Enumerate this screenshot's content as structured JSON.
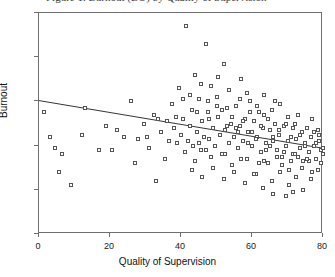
{
  "figure": {
    "top_clipped_caption": "Figure 1. Burnout (BO) by Quality of Supervision",
    "background_color": "#ffffff",
    "frame_color": "#6f6f6f",
    "marker_edge_color": "#555555",
    "regression_line_color": "#333333"
  },
  "chart_data": {
    "type": "scatter",
    "title": "",
    "xlabel": "Quality of Supervision",
    "ylabel": "Burnout",
    "xlim": [
      0,
      80
    ],
    "ylim": [
      0,
      50
    ],
    "xticks": [
      0,
      20,
      40,
      60,
      80
    ],
    "yticks": [
      0,
      10,
      20,
      30,
      40,
      50
    ],
    "grid": false,
    "legend": null,
    "marker": "open-square",
    "trendline": {
      "type": "linear-regression",
      "x_start": 0,
      "y_start": 30.0,
      "x_end": 80,
      "y_end": 19.2,
      "slope": -0.135,
      "intercept": 30.0
    },
    "points": [
      [
        1.5,
        27.5
      ],
      [
        3.0,
        22.0
      ],
      [
        4.5,
        19.5
      ],
      [
        5.5,
        14.0
      ],
      [
        6.5,
        18.0
      ],
      [
        9.0,
        11.0
      ],
      [
        12.0,
        22.5
      ],
      [
        13.0,
        28.5
      ],
      [
        17.0,
        19.0
      ],
      [
        19.0,
        24.5
      ],
      [
        20.5,
        19.0
      ],
      [
        22.0,
        23.5
      ],
      [
        24.0,
        22.0
      ],
      [
        26.0,
        30.0
      ],
      [
        27.0,
        16.0
      ],
      [
        28.0,
        21.5
      ],
      [
        29.5,
        25.0
      ],
      [
        31.0,
        19.5
      ],
      [
        32.5,
        27.0
      ],
      [
        33.0,
        12.0
      ],
      [
        34.5,
        23.0
      ],
      [
        35.5,
        17.0
      ],
      [
        36.5,
        21.0
      ],
      [
        37.5,
        29.5
      ],
      [
        38.0,
        24.0
      ],
      [
        39.0,
        20.5
      ],
      [
        39.5,
        33.0
      ],
      [
        40.0,
        22.5
      ],
      [
        40.5,
        26.0
      ],
      [
        41.0,
        18.5
      ],
      [
        41.5,
        47.0
      ],
      [
        42.0,
        21.0
      ],
      [
        42.5,
        24.5
      ],
      [
        43.0,
        28.0
      ],
      [
        43.5,
        20.0
      ],
      [
        44.0,
        16.5
      ],
      [
        44.5,
        23.0
      ],
      [
        45.0,
        30.5
      ],
      [
        45.5,
        19.0
      ],
      [
        46.0,
        25.5
      ],
      [
        46.5,
        22.0
      ],
      [
        47.0,
        43.0
      ],
      [
        47.5,
        27.5
      ],
      [
        48.0,
        21.5
      ],
      [
        48.5,
        17.5
      ],
      [
        49.0,
        24.0
      ],
      [
        49.5,
        20.0
      ],
      [
        50.0,
        31.0
      ],
      [
        50.5,
        26.5
      ],
      [
        51.0,
        22.5
      ],
      [
        51.5,
        18.0
      ],
      [
        52.0,
        38.5
      ],
      [
        52.5,
        23.5
      ],
      [
        53.0,
        28.5
      ],
      [
        53.5,
        20.5
      ],
      [
        54.0,
        25.0
      ],
      [
        54.5,
        15.5
      ],
      [
        55.0,
        22.0
      ],
      [
        55.5,
        29.0
      ],
      [
        56.0,
        19.5
      ],
      [
        56.5,
        24.5
      ],
      [
        57.0,
        35.0
      ],
      [
        57.5,
        21.0
      ],
      [
        58.0,
        26.0
      ],
      [
        58.5,
        17.0
      ],
      [
        59.0,
        23.0
      ],
      [
        59.5,
        30.0
      ],
      [
        60.0,
        20.0
      ],
      [
        60.5,
        25.5
      ],
      [
        61.0,
        13.5
      ],
      [
        61.5,
        22.0
      ],
      [
        62.0,
        27.5
      ],
      [
        62.5,
        18.5
      ],
      [
        63.0,
        24.0
      ],
      [
        63.5,
        31.5
      ],
      [
        64.0,
        20.5
      ],
      [
        64.5,
        16.0
      ],
      [
        65.0,
        23.5
      ],
      [
        65.5,
        28.0
      ],
      [
        66.0,
        21.0
      ],
      [
        66.5,
        25.0
      ],
      [
        67.0,
        19.0
      ],
      [
        67.5,
        22.5
      ],
      [
        68.0,
        29.5
      ],
      [
        68.5,
        17.5
      ],
      [
        69.0,
        24.5
      ],
      [
        69.5,
        20.0
      ],
      [
        70.0,
        26.5
      ],
      [
        70.5,
        14.5
      ],
      [
        71.0,
        22.0
      ],
      [
        71.5,
        18.0
      ],
      [
        72.0,
        25.0
      ],
      [
        72.5,
        21.5
      ],
      [
        73.0,
        27.0
      ],
      [
        73.5,
        19.5
      ],
      [
        74.0,
        23.0
      ],
      [
        74.5,
        16.5
      ],
      [
        75.0,
        20.5
      ],
      [
        75.5,
        24.0
      ],
      [
        76.0,
        18.5
      ],
      [
        76.5,
        22.0
      ],
      [
        77.0,
        26.0
      ],
      [
        77.5,
        20.0
      ],
      [
        78.0,
        17.0
      ],
      [
        78.5,
        23.5
      ],
      [
        79.0,
        21.0
      ],
      [
        79.5,
        19.0
      ],
      [
        80.0,
        19.5
      ],
      [
        44.0,
        36.0
      ],
      [
        45.5,
        34.0
      ],
      [
        48.5,
        33.5
      ],
      [
        50.5,
        35.5
      ],
      [
        53.5,
        32.5
      ],
      [
        56.5,
        30.5
      ],
      [
        58.5,
        32.0
      ],
      [
        61.5,
        29.0
      ],
      [
        63.5,
        27.0
      ],
      [
        66.5,
        30.0
      ],
      [
        43.0,
        14.5
      ],
      [
        46.0,
        13.0
      ],
      [
        49.0,
        15.0
      ],
      [
        52.0,
        12.5
      ],
      [
        55.0,
        14.0
      ],
      [
        58.0,
        11.5
      ],
      [
        60.5,
        13.5
      ],
      [
        63.0,
        10.5
      ],
      [
        65.5,
        12.0
      ],
      [
        68.0,
        14.0
      ],
      [
        70.5,
        11.0
      ],
      [
        72.5,
        13.0
      ],
      [
        74.5,
        10.0
      ],
      [
        76.5,
        12.5
      ],
      [
        78.5,
        14.5
      ],
      [
        51.5,
        28.0
      ],
      [
        54.5,
        26.5
      ],
      [
        57.5,
        25.5
      ],
      [
        59.5,
        27.5
      ],
      [
        62.5,
        24.5
      ],
      [
        64.5,
        26.0
      ],
      [
        67.5,
        23.5
      ],
      [
        69.5,
        25.0
      ],
      [
        71.5,
        24.0
      ],
      [
        73.5,
        22.5
      ],
      [
        42.5,
        31.5
      ],
      [
        47.5,
        30.0
      ],
      [
        50.0,
        29.0
      ],
      [
        55.5,
        24.0
      ],
      [
        60.0,
        23.0
      ],
      [
        66.0,
        22.0
      ],
      [
        70.0,
        21.0
      ],
      [
        75.0,
        20.0
      ],
      [
        77.5,
        23.0
      ],
      [
        79.0,
        22.5
      ],
      [
        44.5,
        27.5
      ],
      [
        48.0,
        26.0
      ],
      [
        53.0,
        24.5
      ],
      [
        56.0,
        23.0
      ],
      [
        61.0,
        21.5
      ],
      [
        65.0,
        20.0
      ],
      [
        69.0,
        18.5
      ],
      [
        73.0,
        17.5
      ],
      [
        76.0,
        16.5
      ],
      [
        78.0,
        20.5
      ],
      [
        45.0,
        20.5
      ],
      [
        47.0,
        19.0
      ],
      [
        52.5,
        18.0
      ],
      [
        57.0,
        17.0
      ],
      [
        62.0,
        16.0
      ],
      [
        68.5,
        15.5
      ],
      [
        71.0,
        16.5
      ],
      [
        74.0,
        15.0
      ],
      [
        77.0,
        14.0
      ],
      [
        79.5,
        16.0
      ],
      [
        40.5,
        30.5
      ],
      [
        38.5,
        26.5
      ],
      [
        36.0,
        25.5
      ],
      [
        33.5,
        26.0
      ],
      [
        30.5,
        22.0
      ],
      [
        59.0,
        20.5
      ],
      [
        64.0,
        19.0
      ],
      [
        72.0,
        18.0
      ],
      [
        75.5,
        17.0
      ],
      [
        80.0,
        18.0
      ],
      [
        66.0,
        9.0
      ],
      [
        69.5,
        8.5
      ],
      [
        71.5,
        9.5
      ],
      [
        63.5,
        16.5
      ],
      [
        67.0,
        17.5
      ]
    ]
  },
  "axes": {
    "x": {
      "label": "Quality of Supervision",
      "ticks": [
        "0",
        "20",
        "40",
        "60",
        "80"
      ]
    },
    "y": {
      "label": "Burnout",
      "ticks": [
        "0",
        "10",
        "20",
        "30",
        "40",
        "50"
      ]
    }
  }
}
